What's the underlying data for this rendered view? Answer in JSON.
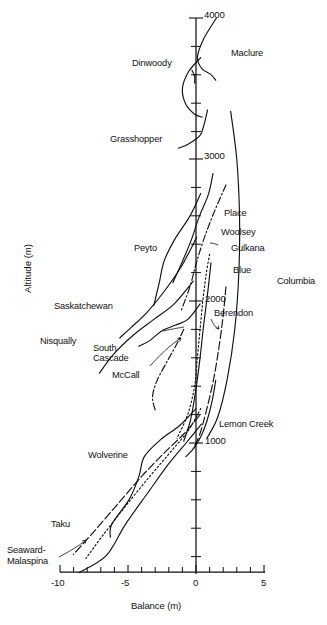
{
  "figure": {
    "background": "#ffffff",
    "ink": "#111111"
  },
  "axes": {
    "x_label": "Balance (m)",
    "y_label": "Altitude (m)",
    "x_ticks": [
      "-10",
      "-5",
      "0",
      "5"
    ],
    "y_ticks": [
      "4000",
      "3000",
      "2000",
      "1000"
    ]
  },
  "labels": {
    "dinwoody": "Dinwoody",
    "maclure": "Maclure",
    "grasshopper": "Grasshopper",
    "place": "Place",
    "woolsey": "Woolsey",
    "gulkana": "Gulkana",
    "blue": "Blue",
    "columbia": "Columbia",
    "peyto": "Peyto",
    "saskatchewan": "Saskatchewan",
    "nisqually": "Nisqually",
    "south_cascade_1": "South",
    "south_cascade_2": "Cascade",
    "mccall": "McCall",
    "berendon": "Berendon",
    "lemon_creek": "Lemon Creek",
    "wolverine": "Wolverine",
    "taku": "Taku",
    "seaward_1": "Seaward-",
    "seaward_2": "Malaspina"
  },
  "chart_data": {
    "type": "line",
    "title": "",
    "xlabel": "Balance (m)",
    "ylabel": "Altitude (m)",
    "xlim": [
      -10,
      5
    ],
    "ylim": [
      70,
      4000
    ],
    "xticks": [
      -10,
      -5,
      0,
      5
    ],
    "yticks": [
      1000,
      2000,
      3000,
      4000
    ],
    "x_minor_tick_step": 1,
    "y_minor_tick_step": 200,
    "grid": false,
    "legend": "inline annotations next to each curve",
    "series": [
      {
        "name": "Maclure",
        "style": "solid",
        "label_position": {
          "balance": 2.4,
          "altitude": 3620
        },
        "points": [
          {
            "balance": 1.5,
            "altitude": 4000
          },
          {
            "balance": 0.55,
            "altitude": 3850
          },
          {
            "balance": 0.1,
            "altitude": 3720
          },
          {
            "balance": 0.45,
            "altitude": 3640
          },
          {
            "balance": 1.1,
            "altitude": 3600
          },
          {
            "balance": 1.45,
            "altitude": 3560
          }
        ]
      },
      {
        "name": "Dinwoody",
        "style": "solid",
        "label_position": {
          "balance": -4.2,
          "altitude": 3580
        },
        "points": [
          {
            "balance": 0.35,
            "altitude": 3720
          },
          {
            "balance": -0.55,
            "altitude": 3620
          },
          {
            "balance": -1.0,
            "altitude": 3500
          },
          {
            "balance": -0.75,
            "altitude": 3390
          },
          {
            "balance": -0.1,
            "altitude": 3320
          },
          {
            "balance": 0.45,
            "altitude": 3300
          }
        ]
      },
      {
        "name": "Dinwoody-branch",
        "style": "solid",
        "label_position": null,
        "points": [
          {
            "balance": -0.3,
            "altitude": 3630
          },
          {
            "balance": -0.1,
            "altitude": 3590
          },
          {
            "balance": -0.1,
            "altitude": 3540
          }
        ]
      },
      {
        "name": "Grasshopper",
        "style": "solid",
        "label_position": {
          "balance": -5.2,
          "altitude": 3080
        },
        "points": [
          {
            "balance": 0.85,
            "altitude": 3350
          },
          {
            "balance": 0.6,
            "altitude": 3250
          },
          {
            "balance": 0.3,
            "altitude": 3170
          },
          {
            "balance": -0.55,
            "altitude": 3110
          },
          {
            "balance": -1.3,
            "altitude": 3080
          }
        ]
      },
      {
        "name": "Place",
        "style": "solid",
        "label_position": {
          "balance": 1.2,
          "altitude": 2580
        },
        "points": [
          {
            "balance": 1.25,
            "altitude": 2900
          },
          {
            "balance": 0.9,
            "altitude": 2750
          },
          {
            "balance": 0.25,
            "altitude": 2600
          },
          {
            "balance": -0.35,
            "altitude": 2430
          },
          {
            "balance": -1.0,
            "altitude": 2280
          },
          {
            "balance": -1.7,
            "altitude": 2130
          }
        ]
      },
      {
        "name": "Woolsey",
        "style": "dash-dot",
        "label_position": {
          "balance": 1.2,
          "altitude": 2460
        },
        "points": [
          {
            "balance": 2.2,
            "altitude": 2820
          },
          {
            "balance": 1.3,
            "altitude": 2620
          },
          {
            "balance": 0.55,
            "altitude": 2430
          },
          {
            "balance": 0.0,
            "altitude": 2260
          },
          {
            "balance": -0.45,
            "altitude": 2100
          },
          {
            "balance": -1.1,
            "altitude": 1930
          }
        ]
      },
      {
        "name": "Gulkana",
        "style": "dotted",
        "label_position": {
          "balance": 1.7,
          "altitude": 2350
        },
        "points": [
          {
            "balance": 1.0,
            "altitude": 2330
          },
          {
            "balance": 0.75,
            "altitude": 2190
          },
          {
            "balance": 0.5,
            "altitude": 2000
          },
          {
            "balance": 0.3,
            "altitude": 1800
          },
          {
            "balance": 0.1,
            "altitude": 1600
          },
          {
            "balance": -0.1,
            "altitude": 1400
          },
          {
            "balance": -0.6,
            "altitude": 1200
          },
          {
            "balance": -1.4,
            "altitude": 1030
          }
        ]
      },
      {
        "name": "Blue",
        "style": "solid",
        "label_position": {
          "balance": 1.6,
          "altitude": 2170
        },
        "points": [
          {
            "balance": 1.1,
            "altitude": 2270
          },
          {
            "balance": 0.85,
            "altitude": 2050
          },
          {
            "balance": 0.55,
            "altitude": 1820
          },
          {
            "balance": 0.3,
            "altitude": 1600
          },
          {
            "balance": 0.0,
            "altitude": 1380
          },
          {
            "balance": -0.4,
            "altitude": 1160
          },
          {
            "balance": -0.9,
            "altitude": 1010
          }
        ]
      },
      {
        "name": "Columbia",
        "style": "solid",
        "label_position": {
          "balance": 3.2,
          "altitude": 2150
        },
        "points": [
          {
            "balance": 2.55,
            "altitude": 3340
          },
          {
            "balance": 3.0,
            "altitude": 3000
          },
          {
            "balance": 3.2,
            "altitude": 2600
          },
          {
            "balance": 3.15,
            "altitude": 2200
          },
          {
            "balance": 2.85,
            "altitude": 1800
          },
          {
            "balance": 2.3,
            "altitude": 1450
          },
          {
            "balance": 1.6,
            "altitude": 1180
          },
          {
            "balance": 0.8,
            "altitude": 1030
          }
        ]
      },
      {
        "name": "Berendon",
        "style": "dashed",
        "label_position": {
          "balance": 1.55,
          "altitude": 1970
        },
        "points": [
          {
            "balance": 2.2,
            "altitude": 2100
          },
          {
            "balance": 2.0,
            "altitude": 1900
          },
          {
            "balance": 1.7,
            "altitude": 1680
          },
          {
            "balance": 1.3,
            "altitude": 1450
          },
          {
            "balance": 0.75,
            "altitude": 1220
          },
          {
            "balance": 0.25,
            "altitude": 1050
          },
          {
            "balance": -0.2,
            "altitude": 960
          }
        ]
      },
      {
        "name": "Lemon Creek",
        "style": "solid",
        "label_position": {
          "balance": 1.6,
          "altitude": 1140
        },
        "points": [
          {
            "balance": 1.45,
            "altitude": 1440
          },
          {
            "balance": 1.2,
            "altitude": 1300
          },
          {
            "balance": 0.8,
            "altitude": 1150
          },
          {
            "balance": 0.35,
            "altitude": 1040
          },
          {
            "balance": -0.15,
            "altitude": 960
          },
          {
            "balance": -0.75,
            "altitude": 900
          }
        ]
      },
      {
        "name": "Peyto",
        "style": "solid",
        "label_position": {
          "balance": -4.4,
          "altitude": 2530
        },
        "points": [
          {
            "balance": 0.35,
            "altitude": 2760
          },
          {
            "balance": -0.45,
            "altitude": 2600
          },
          {
            "balance": -1.6,
            "altitude": 2430
          },
          {
            "balance": -2.35,
            "altitude": 2280
          },
          {
            "balance": -2.7,
            "altitude": 2130
          },
          {
            "balance": -3.1,
            "altitude": 1970
          }
        ]
      },
      {
        "name": "Saskatchewan",
        "style": "solid",
        "label_position": {
          "balance": -7.3,
          "altitude": 1980
        },
        "points": [
          {
            "balance": 0.05,
            "altitude": 2450
          },
          {
            "balance": -1.1,
            "altitude": 2240
          },
          {
            "balance": -2.4,
            "altitude": 2060
          },
          {
            "balance": -3.6,
            "altitude": 1920
          },
          {
            "balance": -4.8,
            "altitude": 1810
          },
          {
            "balance": -5.6,
            "altitude": 1740
          }
        ]
      },
      {
        "name": "Nisqually",
        "style": "solid",
        "label_position": {
          "balance": -8.3,
          "altitude": 1740
        },
        "points": [
          {
            "balance": -0.2,
            "altitude": 2140
          },
          {
            "balance": -1.6,
            "altitude": 1980
          },
          {
            "balance": -3.1,
            "altitude": 1870
          },
          {
            "balance": -4.6,
            "altitude": 1760
          },
          {
            "balance": -6.1,
            "altitude": 1620
          },
          {
            "balance": -7.1,
            "altitude": 1490
          }
        ]
      },
      {
        "name": "South Cascade",
        "style": "solid",
        "label_position": {
          "balance": -6.3,
          "altitude": 1600
        },
        "points": [
          {
            "balance": 0.3,
            "altitude": 1980
          },
          {
            "balance": -0.6,
            "altitude": 1870
          },
          {
            "balance": -1.5,
            "altitude": 1830
          },
          {
            "balance": -2.5,
            "altitude": 1790
          },
          {
            "balance": -3.4,
            "altitude": 1720
          },
          {
            "balance": -4.2,
            "altitude": 1680
          }
        ]
      },
      {
        "name": "McCall",
        "style": "dash-dot",
        "label_position": {
          "balance": -5.1,
          "altitude": 1430
        },
        "points": [
          {
            "balance": -0.9,
            "altitude": 1800
          },
          {
            "balance": -1.5,
            "altitude": 1680
          },
          {
            "balance": -2.2,
            "altitude": 1560
          },
          {
            "balance": -2.9,
            "altitude": 1430
          },
          {
            "balance": -3.2,
            "altitude": 1320
          },
          {
            "balance": -3.0,
            "altitude": 1230
          }
        ]
      },
      {
        "name": "Wolverine",
        "style": "solid",
        "label_position": {
          "balance": -6.1,
          "altitude": 920
        },
        "points": [
          {
            "balance": 0.0,
            "altitude": 1240
          },
          {
            "balance": -1.2,
            "altitude": 1120
          },
          {
            "balance": -2.6,
            "altitude": 1020
          },
          {
            "balance": -3.8,
            "altitude": 900
          },
          {
            "balance": -4.2,
            "altitude": 760
          },
          {
            "balance": -4.9,
            "altitude": 600
          },
          {
            "balance": -6.2,
            "altitude": 420
          },
          {
            "balance": -6.3,
            "altitude": 330
          }
        ]
      },
      {
        "name": "Taku",
        "style": "dashed",
        "label_position": {
          "balance": -8.3,
          "altitude": 330
        },
        "points": [
          {
            "balance": 0.25,
            "altitude": 1190
          },
          {
            "balance": -0.9,
            "altitude": 1060
          },
          {
            "balance": -2.3,
            "altitude": 930
          },
          {
            "balance": -4.0,
            "altitude": 760
          },
          {
            "balance": -5.8,
            "altitude": 560
          },
          {
            "balance": -7.6,
            "altitude": 360
          },
          {
            "balance": -9.0,
            "altitude": 210
          }
        ]
      },
      {
        "name": "Seaward-Malaspina",
        "style": "dotted",
        "label_position": {
          "balance": -9.6,
          "altitude": 210
        },
        "points": [
          {
            "balance": 0.35,
            "altitude": 1240
          },
          {
            "balance": -0.6,
            "altitude": 1080
          },
          {
            "balance": -1.9,
            "altitude": 930
          },
          {
            "balance": -3.4,
            "altitude": 760
          },
          {
            "balance": -5.1,
            "altitude": 560
          },
          {
            "balance": -6.8,
            "altitude": 350
          },
          {
            "balance": -8.1,
            "altitude": 180
          }
        ]
      },
      {
        "name": "unnamed-lower-1",
        "style": "solid",
        "label_position": null,
        "points": [
          {
            "balance": 0.4,
            "altitude": 1130
          },
          {
            "balance": -0.7,
            "altitude": 1000
          },
          {
            "balance": -2.0,
            "altitude": 850
          },
          {
            "balance": -3.5,
            "altitude": 650
          },
          {
            "balance": -5.2,
            "altitude": 420
          },
          {
            "balance": -6.6,
            "altitude": 200
          },
          {
            "balance": -8.6,
            "altitude": 80
          }
        ]
      }
    ]
  }
}
